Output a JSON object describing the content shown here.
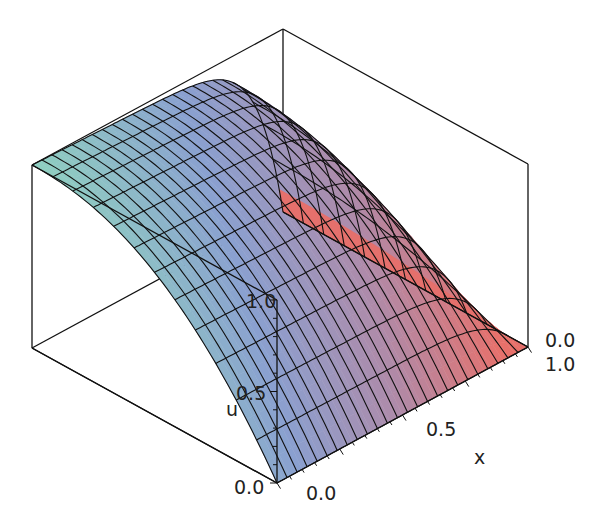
{
  "chart_data": {
    "type": "surface3d",
    "title": "",
    "axes": {
      "x": {
        "label": "x",
        "ticks": [
          "0.0",
          "0.5",
          "1.0"
        ],
        "range": [
          0,
          1
        ]
      },
      "t": {
        "label": "",
        "ticks": [
          "0.0"
        ],
        "range": [
          0,
          1
        ]
      },
      "u": {
        "label": "u",
        "ticks": [
          "0.0",
          "0.5",
          "1.0"
        ],
        "range": [
          0,
          1
        ]
      }
    },
    "grid": {
      "x_lines": 25,
      "t_lines": 12
    },
    "boxed": true,
    "colormap": [
      "#8fd0c0",
      "#8aa0d0",
      "#b08aa8",
      "#e8706a"
    ]
  },
  "labels": {
    "u_label": "u",
    "u_tick_0": "0.0",
    "u_tick_05": "0.5",
    "u_tick_1": "1.0",
    "x_label": "x",
    "x_tick_0": "0.0",
    "x_tick_05": "0.5",
    "x_tick_1": "1.0",
    "t_tick_0": "0.0"
  }
}
